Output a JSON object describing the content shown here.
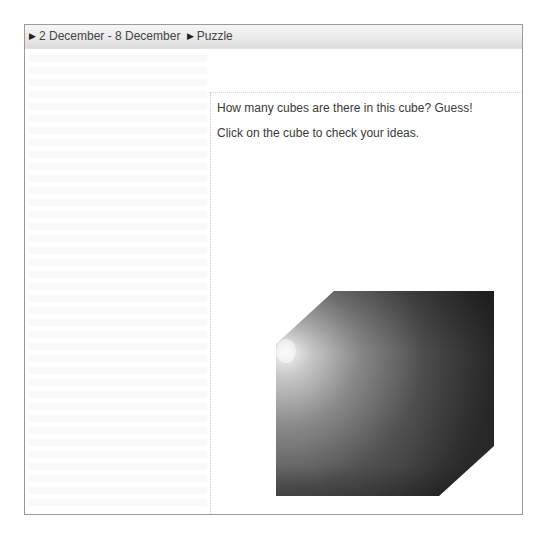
{
  "breadcrumb": {
    "items": [
      {
        "icon": "play-arrow-icon",
        "glyph": "▶",
        "label": "2 December - 8 December"
      },
      {
        "icon": "play-arrow-icon",
        "glyph": "▶",
        "label": "Puzzle"
      }
    ]
  },
  "puzzle": {
    "question": "How many cubes are there in this cube? Guess!",
    "instruction": "Click on the cube to check your ideas.",
    "cube": {
      "icon": "cube-icon",
      "colors": {
        "highlight": "#f4f4f4",
        "mid": "#8a8a8a",
        "dark": "#3a3a3a",
        "darkest": "#2a2a2a"
      }
    }
  }
}
